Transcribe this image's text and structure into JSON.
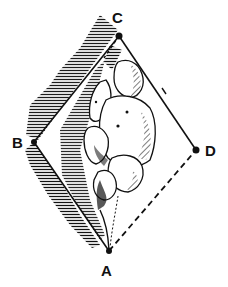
{
  "figure": {
    "points": [
      {
        "id": "A",
        "label": "A",
        "x": 109,
        "y": 251
      },
      {
        "id": "B",
        "label": "B",
        "x": 34,
        "y": 142
      },
      {
        "id": "C",
        "label": "C",
        "x": 119,
        "y": 36
      },
      {
        "id": "D",
        "label": "D",
        "x": 196,
        "y": 150
      }
    ],
    "lines": {
      "solid": [
        "C-D",
        "C-B",
        "B-A"
      ],
      "dashed": [
        "A-D",
        "C-interior"
      ]
    },
    "colors": {
      "ink": "#111111",
      "paper": "#ffffff"
    }
  }
}
